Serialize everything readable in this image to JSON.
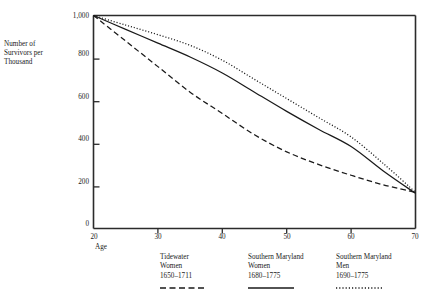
{
  "axes": {
    "ylabel_lines": [
      "Number of",
      "Survivors per",
      "Thousand"
    ],
    "xlabel": "Age",
    "yticks": [
      "0",
      "200",
      "400",
      "600",
      "800",
      "1,000"
    ],
    "xticks": [
      "20",
      "30",
      "40",
      "50",
      "60",
      "70"
    ]
  },
  "legend": {
    "entries": [
      {
        "line1": "Tidewater",
        "line2": "Women",
        "line3": "1650–1711",
        "style": "dashed",
        "sample_name": "legend-sample-dashed"
      },
      {
        "line1": "Southern Maryland",
        "line2": "Women",
        "line3": "1680–1775",
        "style": "solid",
        "sample_name": "legend-sample-solid"
      },
      {
        "line1": "Southern Maryland",
        "line2": "Men",
        "line3": "1690–1775",
        "style": "dotted",
        "sample_name": "legend-sample-dotted"
      }
    ]
  },
  "colors": {
    "ink": "#1a1a1a",
    "axis": "#2b2b2b",
    "background": "#ffffff"
  },
  "chart_data": {
    "type": "line",
    "title": "",
    "subtitle": "",
    "xlabel": "Age",
    "ylabel": "Number of Survivors per Thousand",
    "xlim": [
      20,
      70
    ],
    "ylim": [
      0,
      1000
    ],
    "xticks": [
      20,
      30,
      40,
      50,
      60,
      70
    ],
    "yticks": [
      0,
      200,
      400,
      600,
      800,
      1000
    ],
    "grid": false,
    "legend_position": "below-axes",
    "x": [
      20,
      25,
      30,
      35,
      40,
      45,
      50,
      55,
      60,
      65,
      70
    ],
    "series": [
      {
        "name": "Tidewater Women 1650–1711",
        "style": "dashed",
        "values": [
          1000,
          880,
          760,
          640,
          540,
          440,
          360,
          300,
          250,
          205,
          170
        ]
      },
      {
        "name": "Southern Maryland Women 1680–1775",
        "style": "solid",
        "values": [
          1000,
          935,
          870,
          805,
          730,
          640,
          550,
          465,
          385,
          270,
          165
        ]
      },
      {
        "name": "Southern Maryland Men 1690–1775",
        "style": "dotted",
        "values": [
          1000,
          955,
          910,
          860,
          790,
          700,
          610,
          520,
          430,
          305,
          170
        ]
      }
    ]
  }
}
